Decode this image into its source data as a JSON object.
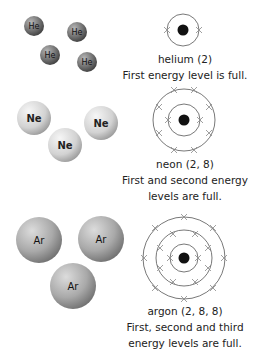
{
  "sections": [
    {
      "element": "helium",
      "symbol": "He",
      "name_label": "helium (2)",
      "description_lines": [
        "First energy level is full."
      ],
      "electron_configuration": [
        2
      ]
    },
    {
      "element": "neon",
      "symbol": "Ne",
      "name_label": "neon (2, 8)",
      "description_lines": [
        "First and second energy",
        "levels are full."
      ],
      "electron_configuration": [
        2,
        8
      ]
    },
    {
      "element": "argon",
      "symbol": "Ar",
      "name_label": "argon (2, 8, 8)",
      "description_lines": [
        "First, second and third",
        "energy levels are full."
      ],
      "electron_configuration": [
        2,
        8,
        8
      ]
    }
  ],
  "colors": {
    "helium_atom": "#6e6e6e",
    "neon_atom": "#d0d0d0",
    "argon_atom": "#a8a8a8",
    "shell_line": "#555555",
    "electron": "#888888",
    "nucleus": "#111111"
  }
}
